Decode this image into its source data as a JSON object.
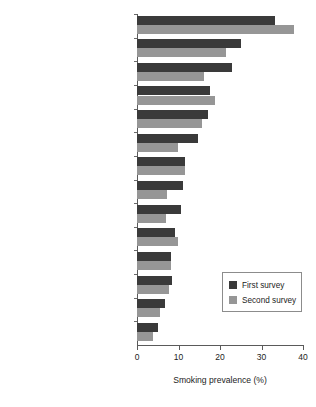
{
  "chart_data": {
    "type": "bar",
    "orientation": "horizontal",
    "title": "",
    "xlabel": "Smoking prevalence (%)",
    "ylabel": "",
    "xlim": [
      0,
      40
    ],
    "xticks": [
      0,
      10,
      20,
      30,
      40
    ],
    "xtick_labels": [
      "0",
      "10",
      "20",
      "30",
      "40"
    ],
    "grid": false,
    "legend_position": "center-right",
    "categories": [
      "Chile (2000, 2003)",
      "Argentina (2000, 2003)",
      "Bolivia (2000, 2003)",
      "Peru (2000, 2004)",
      "Costa Rica (1999, 2002)",
      "Cuba (2001, 2004)",
      "Dominica (2000, 2004)",
      "Suriname (2000, 2004)",
      "Barbados (1999, 2002)",
      "Grenada (2000, 2004)",
      "Guyana (2000, 2004)",
      "Venezuela (1999, 2004)",
      "Bahamas (2000, 2003)",
      "Antigua and Barbuda (2000, 2004)"
    ],
    "series": [
      {
        "name": "First survey",
        "color": "#3a3a3a",
        "values": [
          33.2,
          25.0,
          22.9,
          17.6,
          17.1,
          14.6,
          11.6,
          11.0,
          10.5,
          9.2,
          8.2,
          8.4,
          6.7,
          5.0
        ]
      },
      {
        "name": "Second survey",
        "color": "#969696",
        "values": [
          37.8,
          21.5,
          16.2,
          18.9,
          15.6,
          9.9,
          11.5,
          7.3,
          7.0,
          9.9,
          8.2,
          7.7,
          5.5,
          3.8
        ]
      }
    ]
  },
  "legend": {
    "items": [
      {
        "label": "First survey"
      },
      {
        "label": "Second survey"
      }
    ]
  },
  "axis": {
    "x_title": "Smoking prevalence (%)"
  },
  "colors": {
    "first_survey": "#3a3a3a",
    "second_survey": "#969696",
    "axis": "#5a5a5a",
    "background": "#ffffff"
  }
}
